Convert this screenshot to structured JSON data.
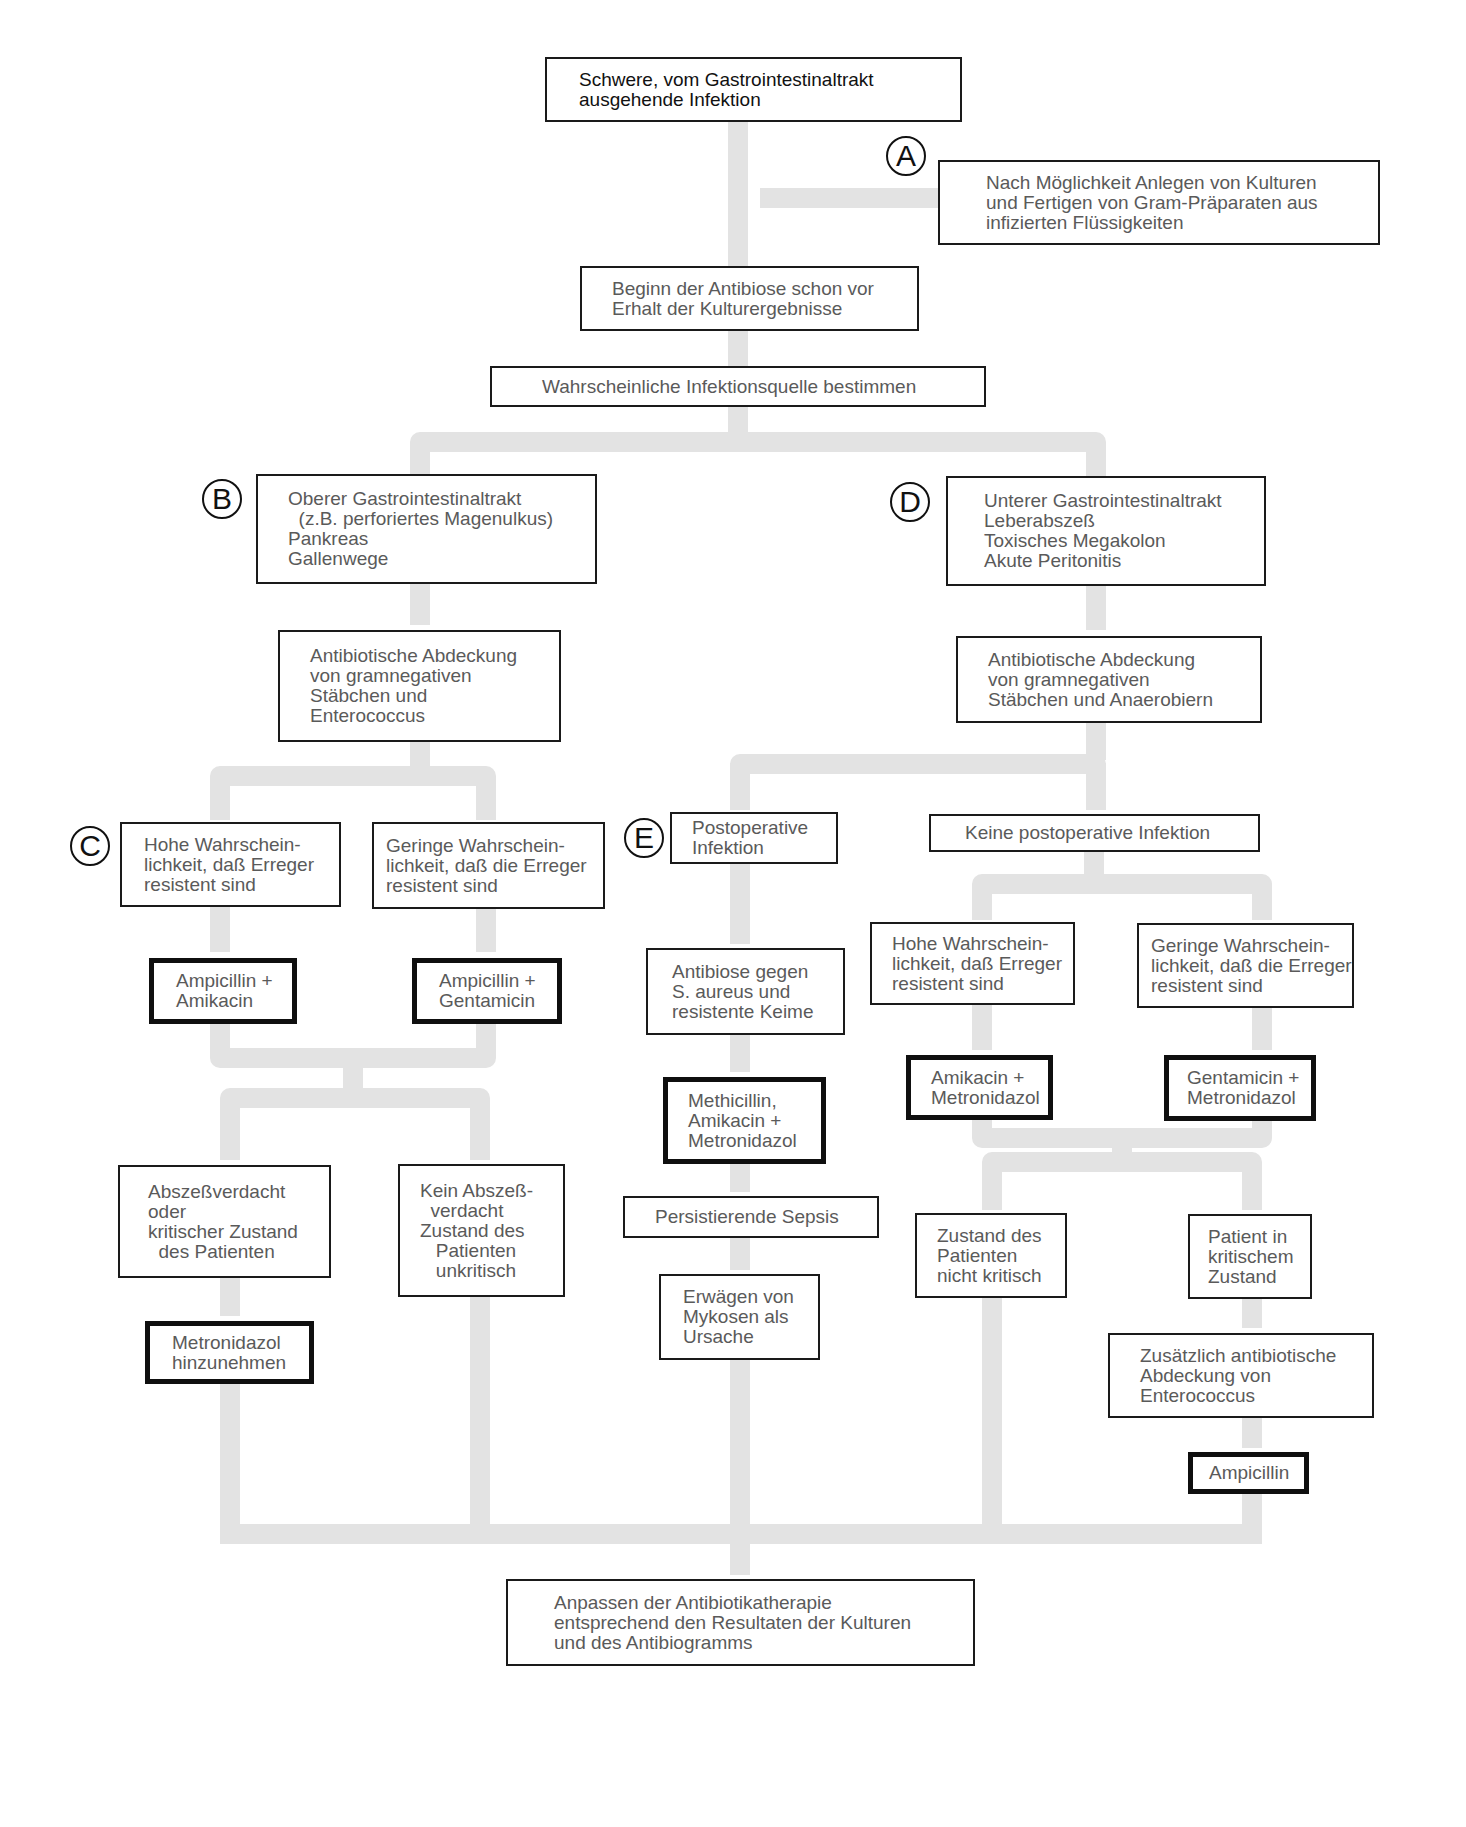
{
  "diagram": {
    "connector_color": "#e3e3e3",
    "box_border_color": "#1a1a1a",
    "text_color": "#5a5a5a",
    "markers": [
      {
        "id": "A",
        "label": "A",
        "x": 886,
        "y": 136
      },
      {
        "id": "B",
        "label": "B",
        "x": 202,
        "y": 479
      },
      {
        "id": "C",
        "label": "C",
        "x": 70,
        "y": 826
      },
      {
        "id": "D",
        "label": "D",
        "x": 890,
        "y": 482
      },
      {
        "id": "E",
        "label": "E",
        "x": 624,
        "y": 818
      }
    ],
    "nodes": [
      {
        "id": "start",
        "type": "title",
        "x": 545,
        "y": 57,
        "w": 417,
        "h": 65,
        "pad": 32,
        "lines": [
          "Schwere, vom Gastrointestinaltrakt",
          "ausgehende Infektion"
        ]
      },
      {
        "id": "cultures",
        "type": "step",
        "x": 938,
        "y": 160,
        "w": 442,
        "h": 85,
        "pad": 46,
        "lines": [
          "Nach Möglichkeit Anlegen von Kulturen",
          "und Fertigen von Gram-Präparaten aus",
          "infizierten Flüssigkeiten"
        ]
      },
      {
        "id": "start_antibiosis",
        "type": "step",
        "x": 580,
        "y": 266,
        "w": 339,
        "h": 65,
        "pad": 30,
        "lines": [
          "Beginn der Antibiose schon vor",
          "Erhalt der Kulturergebnisse"
        ]
      },
      {
        "id": "source",
        "type": "step",
        "x": 490,
        "y": 366,
        "w": 496,
        "h": 41,
        "pad": 50,
        "lines": [
          "Wahrscheinliche Infektionsquelle bestimmen"
        ]
      },
      {
        "id": "upper_gi",
        "type": "step",
        "x": 256,
        "y": 474,
        "w": 341,
        "h": 110,
        "pad": 30,
        "lines": [
          "Oberer Gastrointestinaltrakt",
          "  (z.B. perforiertes Magenulkus)",
          "Pankreas",
          "Gallenwege"
        ]
      },
      {
        "id": "lower_gi",
        "type": "step",
        "x": 946,
        "y": 476,
        "w": 320,
        "h": 110,
        "pad": 36,
        "lines": [
          "Unterer Gastrointestinaltrakt",
          "Leberabszeß",
          "Toxisches Megakolon",
          "Akute Peritonitis"
        ]
      },
      {
        "id": "cover_entero",
        "type": "step",
        "x": 278,
        "y": 630,
        "w": 283,
        "h": 112,
        "pad": 30,
        "lines": [
          "Antibiotische Abdeckung",
          "von gramnegativen",
          "Stäbchen und",
          "Enterococcus"
        ]
      },
      {
        "id": "cover_anaerob",
        "type": "step",
        "x": 956,
        "y": 636,
        "w": 306,
        "h": 87,
        "pad": 30,
        "lines": [
          "Antibiotische Abdeckung",
          "von gramnegativen",
          "Stäbchen und Anaerobiern"
        ]
      },
      {
        "id": "c_high",
        "type": "step",
        "x": 120,
        "y": 822,
        "w": 221,
        "h": 85,
        "pad": 22,
        "lines": [
          "Hohe Wahrschein-",
          "lichkeit, daß Erreger",
          "resistent sind"
        ]
      },
      {
        "id": "c_low",
        "type": "step",
        "x": 372,
        "y": 822,
        "w": 233,
        "h": 87,
        "pad": 12,
        "lines": [
          "Geringe Wahrschein-",
          "lichkeit, daß die Erreger",
          "resistent sind"
        ]
      },
      {
        "id": "drug_amp_amik",
        "type": "drug",
        "x": 149,
        "y": 958,
        "w": 148,
        "h": 66,
        "pad": 22,
        "lines": [
          "Ampicillin +",
          "Amikacin"
        ]
      },
      {
        "id": "drug_amp_gent",
        "type": "drug",
        "x": 412,
        "y": 958,
        "w": 150,
        "h": 66,
        "pad": 22,
        "lines": [
          "Ampicillin +",
          "Gentamicin"
        ]
      },
      {
        "id": "abscess",
        "type": "step",
        "x": 118,
        "y": 1165,
        "w": 213,
        "h": 113,
        "pad": 28,
        "lines": [
          "Abszeßverdacht",
          "oder",
          "kritischer Zustand",
          "  des Patienten"
        ]
      },
      {
        "id": "no_abscess",
        "type": "step",
        "x": 398,
        "y": 1164,
        "w": 167,
        "h": 133,
        "pad": 20,
        "lines": [
          "Kein Abszeß-",
          "  verdacht",
          "Zustand des",
          "   Patienten",
          "   unkritisch"
        ]
      },
      {
        "id": "drug_metro_add",
        "type": "drug",
        "x": 145,
        "y": 1321,
        "w": 169,
        "h": 63,
        "pad": 22,
        "lines": [
          "Metronidazol",
          "hinzunehmen"
        ]
      },
      {
        "id": "postop",
        "type": "step",
        "x": 670,
        "y": 812,
        "w": 168,
        "h": 52,
        "pad": 20,
        "lines": [
          "Postoperative",
          "Infektion"
        ]
      },
      {
        "id": "no_postop",
        "type": "step",
        "x": 929,
        "y": 814,
        "w": 331,
        "h": 38,
        "pad": 34,
        "lines": [
          "Keine postoperative Infektion"
        ]
      },
      {
        "id": "anti_saureus",
        "type": "step",
        "x": 646,
        "y": 948,
        "w": 199,
        "h": 87,
        "pad": 24,
        "lines": [
          "Antibiose gegen",
          "S. aureus und",
          "resistente Keime"
        ]
      },
      {
        "id": "drug_methi",
        "type": "drug",
        "x": 663,
        "y": 1077,
        "w": 163,
        "h": 87,
        "pad": 20,
        "lines": [
          "Methicillin,",
          "Amikacin +",
          "Metronidazol"
        ]
      },
      {
        "id": "sepsis",
        "type": "step",
        "x": 623,
        "y": 1196,
        "w": 256,
        "h": 42,
        "pad": 30,
        "lines": [
          "Persistierende Sepsis"
        ]
      },
      {
        "id": "mycoses",
        "type": "step",
        "x": 659,
        "y": 1274,
        "w": 161,
        "h": 86,
        "pad": 22,
        "lines": [
          "Erwägen von",
          "Mykosen als",
          "Ursache"
        ]
      },
      {
        "id": "d_high",
        "type": "step",
        "x": 870,
        "y": 922,
        "w": 205,
        "h": 83,
        "pad": 20,
        "lines": [
          "Hohe Wahrschein-",
          "lichkeit, daß Erreger",
          "resistent sind"
        ]
      },
      {
        "id": "d_low",
        "type": "step",
        "x": 1137,
        "y": 923,
        "w": 217,
        "h": 85,
        "pad": 12,
        "lines": [
          "Geringe Wahrschein-",
          "lichkeit, daß die Erreger",
          "resistent sind"
        ]
      },
      {
        "id": "drug_amik_metro",
        "type": "drug",
        "x": 906,
        "y": 1055,
        "w": 147,
        "h": 65,
        "pad": 20,
        "lines": [
          "Amikacin +",
          "Metronidazol"
        ]
      },
      {
        "id": "drug_gent_metro",
        "type": "drug",
        "x": 1164,
        "y": 1055,
        "w": 152,
        "h": 66,
        "pad": 18,
        "lines": [
          "Gentamicin +",
          "Metronidazol"
        ]
      },
      {
        "id": "not_critical",
        "type": "step",
        "x": 915,
        "y": 1213,
        "w": 152,
        "h": 85,
        "pad": 20,
        "lines": [
          "Zustand des",
          "Patienten",
          "nicht kritisch"
        ]
      },
      {
        "id": "critical",
        "type": "step",
        "x": 1188,
        "y": 1214,
        "w": 124,
        "h": 85,
        "pad": 18,
        "lines": [
          "Patient in",
          "kritischem",
          "Zustand"
        ]
      },
      {
        "id": "add_entero",
        "type": "step",
        "x": 1108,
        "y": 1333,
        "w": 266,
        "h": 85,
        "pad": 30,
        "lines": [
          "Zusätzlich antibiotische",
          "Abdeckung von",
          "Enterococcus"
        ]
      },
      {
        "id": "drug_ampicillin",
        "type": "drug",
        "x": 1188,
        "y": 1452,
        "w": 121,
        "h": 42,
        "pad": 16,
        "lines": [
          "Ampicillin"
        ]
      },
      {
        "id": "adjust",
        "type": "step",
        "x": 506,
        "y": 1579,
        "w": 469,
        "h": 87,
        "pad": 46,
        "lines": [
          "Anpassen der Antibiotikatherapie",
          "entsprechend den Resultaten der Kulturen",
          "und des Antibiogramms"
        ]
      }
    ]
  }
}
